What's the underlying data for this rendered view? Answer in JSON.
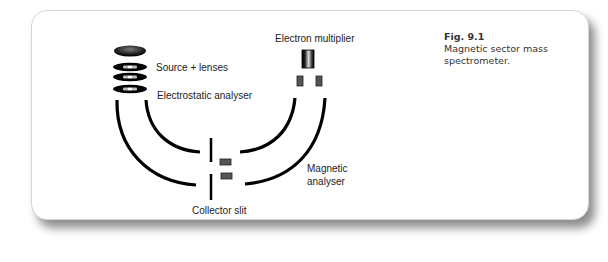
{
  "figure": {
    "number": "Fig. 9.1",
    "caption": "Magnetic sector mass spectrometer."
  },
  "labels": {
    "source_lenses": "Source + lenses",
    "electrostatic_analyser": "Electrostatic analyser",
    "electron_multiplier": "Electron multiplier",
    "magnetic_analyser_line1": "Magnetic",
    "magnetic_analyser_line2": "analyser",
    "collector_slit": "Collector slit"
  },
  "colors": {
    "stroke": "#000000",
    "component_fill": "#555555",
    "background": "#ffffff"
  }
}
